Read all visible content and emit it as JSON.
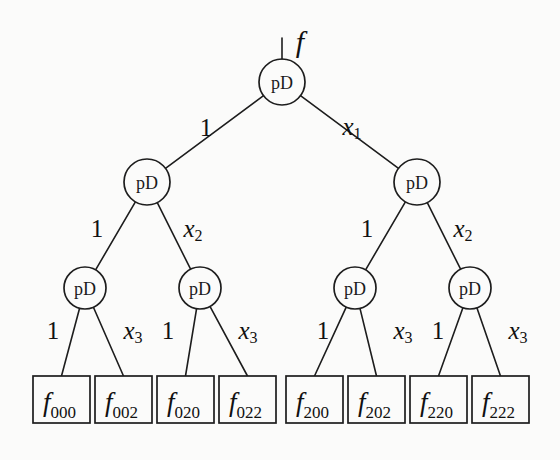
{
  "figure": {
    "kind": "binary-decision-diagram",
    "root_function_label": "f",
    "node_label": "pD",
    "background_color": "#fbfbfa",
    "line_color": "#1d1d1d",
    "text_color": "#111111"
  },
  "nodes": {
    "root": {
      "id": "root",
      "label": "pD",
      "cx": 282,
      "cy": 82,
      "r": 23
    },
    "level1": [
      {
        "id": "n1L",
        "label": "pD",
        "cx": 147,
        "cy": 182,
        "r": 23
      },
      {
        "id": "n1R",
        "label": "pD",
        "cx": 417,
        "cy": 182,
        "r": 23
      }
    ],
    "level2": [
      {
        "id": "n2a",
        "label": "pD",
        "cx": 85,
        "cy": 288,
        "r": 21
      },
      {
        "id": "n2b",
        "label": "pD",
        "cx": 200,
        "cy": 288,
        "r": 21
      },
      {
        "id": "n2c",
        "label": "pD",
        "cx": 355,
        "cy": 288,
        "r": 21
      },
      {
        "id": "n2d",
        "label": "pD",
        "cx": 470,
        "cy": 288,
        "r": 21
      }
    ]
  },
  "edges": {
    "level1": [
      {
        "from": "root",
        "to": "n1L",
        "label": "1",
        "italic": false,
        "sub": "",
        "lx": 206,
        "ly": 127
      },
      {
        "from": "root",
        "to": "n1R",
        "label": "x",
        "italic": true,
        "sub": "1",
        "lx": 352,
        "ly": 126
      }
    ],
    "level2": [
      {
        "from": "n1L",
        "to": "n2a",
        "label": "1",
        "italic": false,
        "sub": "",
        "lx": 97,
        "ly": 228
      },
      {
        "from": "n1L",
        "to": "n2b",
        "label": "x",
        "italic": true,
        "sub": "2",
        "lx": 193,
        "ly": 228
      },
      {
        "from": "n1R",
        "to": "n2c",
        "label": "1",
        "italic": false,
        "sub": "",
        "lx": 367,
        "ly": 228
      },
      {
        "from": "n1R",
        "to": "n2d",
        "label": "x",
        "italic": true,
        "sub": "2",
        "lx": 463,
        "ly": 228
      }
    ],
    "level3": [
      {
        "from": "n2a",
        "to": "leaf0",
        "label": "1",
        "italic": false,
        "sub": "",
        "lx": 53,
        "ly": 330
      },
      {
        "from": "n2a",
        "to": "leaf1",
        "label": "x",
        "italic": true,
        "sub": "3",
        "lx": 133,
        "ly": 330
      },
      {
        "from": "n2b",
        "to": "leaf2",
        "label": "1",
        "italic": false,
        "sub": "",
        "lx": 168,
        "ly": 330
      },
      {
        "from": "n2b",
        "to": "leaf3",
        "label": "x",
        "italic": true,
        "sub": "3",
        "lx": 248,
        "ly": 330
      },
      {
        "from": "n2c",
        "to": "leaf4",
        "label": "1",
        "italic": false,
        "sub": "",
        "lx": 323,
        "ly": 330
      },
      {
        "from": "n2c",
        "to": "leaf5",
        "label": "x",
        "italic": true,
        "sub": "3",
        "lx": 403,
        "ly": 330
      },
      {
        "from": "n2d",
        "to": "leaf6",
        "label": "1",
        "italic": false,
        "sub": "",
        "lx": 438,
        "ly": 330
      },
      {
        "from": "n2d",
        "to": "leaf7",
        "label": "x",
        "italic": true,
        "sub": "3",
        "lx": 518,
        "ly": 330
      }
    ]
  },
  "leaves": [
    {
      "id": "leaf0",
      "base": "f",
      "sub": "000",
      "x": 33,
      "y": 376,
      "w": 57,
      "h": 47
    },
    {
      "id": "leaf1",
      "base": "f",
      "sub": "002",
      "x": 95,
      "y": 376,
      "w": 57,
      "h": 47
    },
    {
      "id": "leaf2",
      "base": "f",
      "sub": "020",
      "x": 157,
      "y": 376,
      "w": 57,
      "h": 47
    },
    {
      "id": "leaf3",
      "base": "f",
      "sub": "022",
      "x": 219,
      "y": 376,
      "w": 57,
      "h": 47
    },
    {
      "id": "leaf4",
      "base": "f",
      "sub": "200",
      "x": 286,
      "y": 376,
      "w": 57,
      "h": 47
    },
    {
      "id": "leaf5",
      "base": "f",
      "sub": "202",
      "x": 348,
      "y": 376,
      "w": 57,
      "h": 47
    },
    {
      "id": "leaf6",
      "base": "f",
      "sub": "220",
      "x": 410,
      "y": 376,
      "w": 57,
      "h": 47
    },
    {
      "id": "leaf7",
      "base": "f",
      "sub": "222",
      "x": 472,
      "y": 376,
      "w": 57,
      "h": 47
    }
  ],
  "root_input": {
    "label": "f",
    "label_x": 300,
    "label_y": 52,
    "stem_x": 282,
    "stem_y1": 38,
    "stem_y2": 59
  }
}
